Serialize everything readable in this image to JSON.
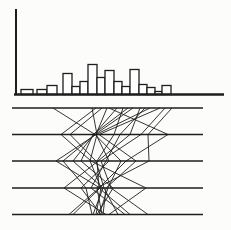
{
  "figure": {
    "width": 231,
    "height": 230
  },
  "colors": {
    "ink": "#1e1e1e",
    "background": "#fcfcfb",
    "bar_fill": "#ffffff"
  },
  "chart_data": [
    {
      "type": "bar",
      "subtype": "histogram",
      "title": "",
      "xlabel": "",
      "ylabel": "",
      "note": "Axes are unlabeled; values are relative heights in pixels read from the drawing",
      "y_axis": {
        "x": 16,
        "y_top": 9,
        "y_bottom": 95,
        "stroke_width": 2
      },
      "baseline": {
        "y": 94.5,
        "x_start": 14,
        "x_end": 224,
        "stroke_width": 2.4
      },
      "bar_stroke_width": 1.3,
      "bars": [
        {
          "x": 21,
          "w": 12,
          "h": 5
        },
        {
          "x": 37,
          "w": 10,
          "h": 5
        },
        {
          "x": 47,
          "w": 10,
          "h": 9
        },
        {
          "x": 63,
          "w": 9,
          "h": 21
        },
        {
          "x": 72,
          "w": 8,
          "h": 8
        },
        {
          "x": 80,
          "w": 8,
          "h": 13
        },
        {
          "x": 88,
          "w": 9,
          "h": 30
        },
        {
          "x": 97,
          "w": 8,
          "h": 17
        },
        {
          "x": 105,
          "w": 9,
          "h": 24
        },
        {
          "x": 114,
          "w": 8,
          "h": 13
        },
        {
          "x": 122,
          "w": 8,
          "h": 8
        },
        {
          "x": 130,
          "w": 9,
          "h": 25
        },
        {
          "x": 139,
          "w": 8,
          "h": 10
        },
        {
          "x": 147,
          "w": 8,
          "h": 7
        },
        {
          "x": 155,
          "w": 7,
          "h": 3
        },
        {
          "x": 162,
          "w": 9,
          "h": 9
        }
      ]
    },
    {
      "type": "line",
      "subtype": "parallel-coordinates",
      "title": "",
      "axes_y": [
        108,
        134.5,
        161,
        188,
        214.5
      ],
      "axis_x_start": 12,
      "axis_x_end": 203,
      "axis_stroke_width": 1.7,
      "polyline_stroke_width": 0.9,
      "polylines": [
        [
          53,
          95,
          63,
          86,
          92
        ],
        [
          92,
          97,
          90,
          101,
          96
        ],
        [
          102,
          70,
          96,
          104,
          118
        ],
        [
          107,
          96,
          109,
          81,
          101
        ],
        [
          117,
          94,
          73,
          103,
          93
        ],
        [
          123,
          114,
          97,
          99,
          130
        ],
        [
          133,
          95,
          121,
          108,
          99
        ],
        [
          140,
          130,
          98,
          64,
          106
        ],
        [
          150,
          96,
          56,
          100,
          73
        ],
        [
          160,
          99,
          136,
          106,
          103
        ],
        [
          165,
          141,
          101,
          111,
          148
        ],
        [
          172,
          148,
          149,
          97,
          102
        ],
        [
          96,
          61,
          91,
          146,
          109
        ],
        [
          109,
          168,
          126,
          99,
          69
        ],
        [
          128,
          93,
          81,
          113,
          97
        ],
        [
          145,
          120,
          106,
          91,
          125
        ]
      ]
    }
  ]
}
